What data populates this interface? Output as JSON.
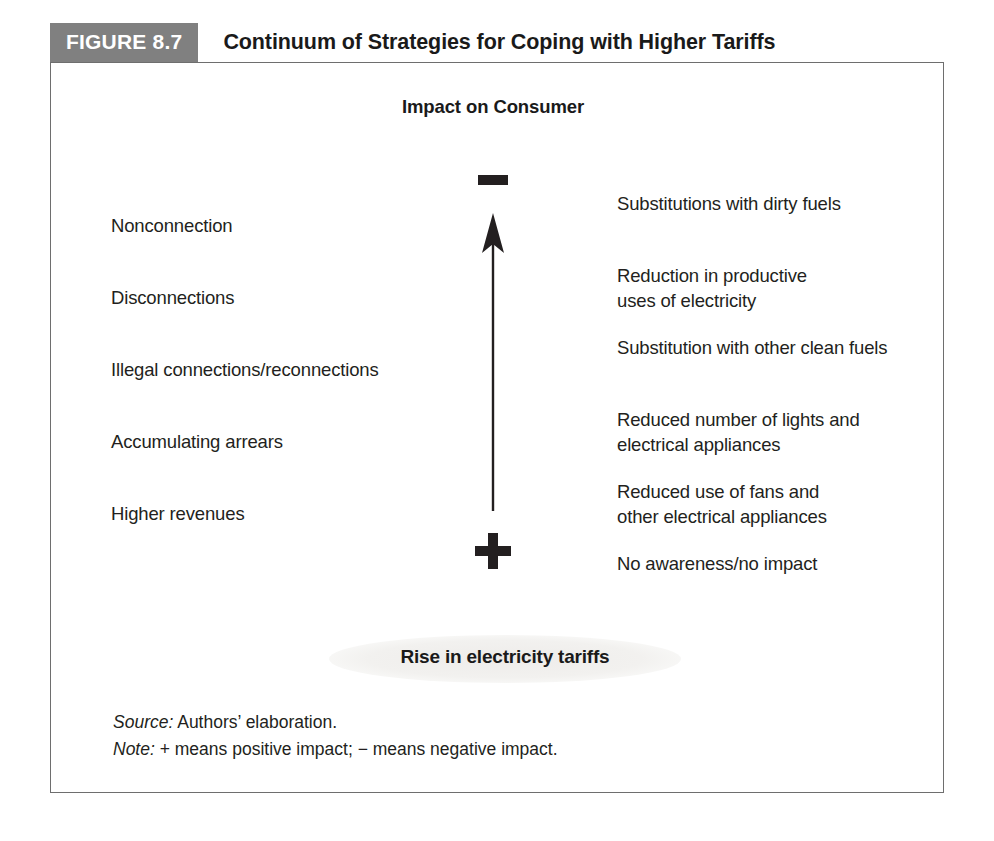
{
  "figure": {
    "badge": "FIGURE 8.7",
    "title": "Continuum of Strategies for Coping with Higher Tariffs"
  },
  "diagram": {
    "heading": "Impact on Consumer",
    "axis": {
      "top_sign": "−",
      "top_sign_name": "minus-sign",
      "bottom_sign": "+",
      "bottom_sign_name": "plus-sign",
      "arrow_direction": "up"
    },
    "left_column": [
      {
        "label": "Nonconnection"
      },
      {
        "label": "Disconnections"
      },
      {
        "label": "Illegal connections/reconnections"
      },
      {
        "label": "Accumulating arrears"
      },
      {
        "label": "Higher revenues"
      }
    ],
    "right_column": [
      {
        "lines": [
          "Substitutions with dirty fuels"
        ]
      },
      {
        "lines": [
          "Reduction in productive",
          "uses of electricity"
        ]
      },
      {
        "lines": [
          "Substitution with other clean fuels"
        ]
      },
      {
        "lines": [
          "Reduced number of lights and",
          "electrical appliances"
        ]
      },
      {
        "lines": [
          "Reduced use of fans and",
          "other electrical appliances"
        ]
      },
      {
        "lines": [
          "No awareness/no impact"
        ]
      }
    ],
    "base_label": "Rise in electricity tariffs"
  },
  "notes": {
    "source_lead": "Source:",
    "source_text": "Authors’ elaboration.",
    "note_lead": "Note:",
    "note_text": "+ means positive impact; − means negative impact."
  },
  "colors": {
    "badge_background": "#808080",
    "badge_text": "#ffffff",
    "frame_border": "#6e6e6e",
    "ink": "#231f20",
    "ellipse_fill": "#f0efee"
  }
}
